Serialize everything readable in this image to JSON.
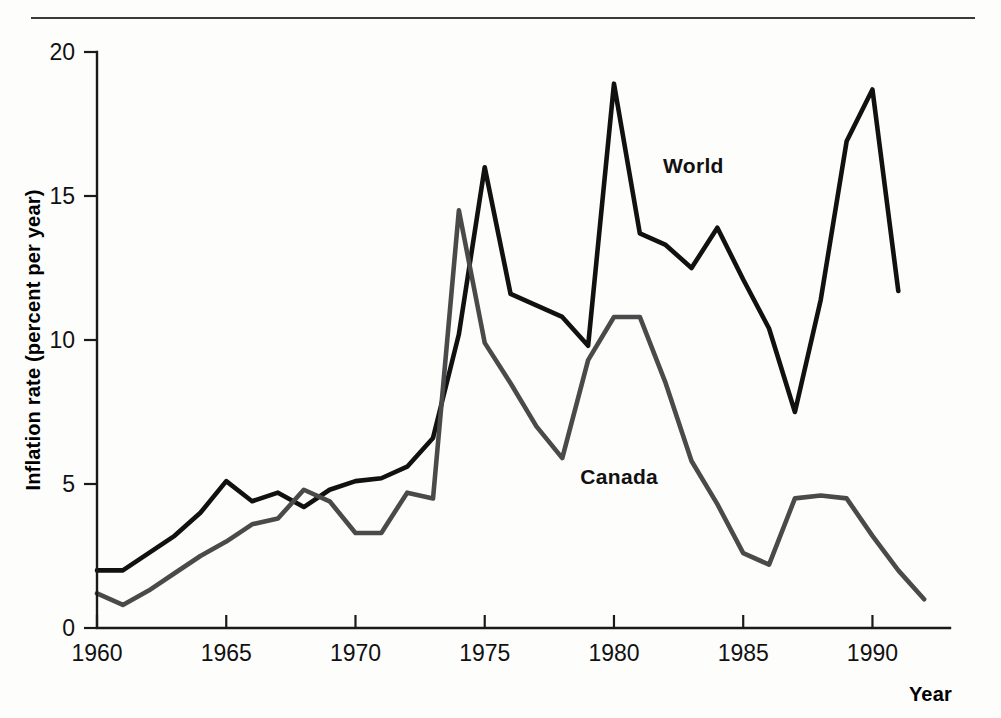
{
  "figure": {
    "has_top_rule": true,
    "background_color": "#fdfdfc"
  },
  "chart_data": {
    "type": "line",
    "title": "",
    "xlabel": "Year",
    "ylabel": "Inflation rate (percent per year)",
    "xlim": [
      1960,
      1993
    ],
    "ylim": [
      0,
      20
    ],
    "xticks": [
      1960,
      1965,
      1970,
      1975,
      1980,
      1985,
      1990
    ],
    "xtick_labels": [
      "1960",
      "1965",
      "1970",
      "1975",
      "1980",
      "1985",
      "1990"
    ],
    "yticks": [
      0,
      5,
      10,
      15,
      20
    ],
    "ytick_labels": [
      "0",
      "5",
      "10",
      "15",
      "20"
    ],
    "grid": false,
    "legend": "inline-labels",
    "series": [
      {
        "name": "World",
        "label": "World",
        "color": "#111111",
        "stroke_width": 4.6,
        "label_x": 1981.9,
        "label_y": 15.8,
        "x": [
          1960,
          1961,
          1962,
          1963,
          1964,
          1965,
          1966,
          1967,
          1968,
          1969,
          1970,
          1971,
          1972,
          1973,
          1974,
          1975,
          1976,
          1977,
          1978,
          1979,
          1980,
          1981,
          1982,
          1983,
          1984,
          1985,
          1986,
          1987,
          1988,
          1989,
          1990,
          1991
        ],
        "y": [
          2.0,
          2.0,
          2.6,
          3.2,
          4.0,
          5.1,
          4.4,
          4.7,
          4.2,
          4.8,
          5.1,
          5.2,
          5.6,
          6.6,
          10.2,
          16.0,
          11.6,
          11.2,
          10.8,
          9.8,
          18.9,
          13.7,
          13.3,
          12.5,
          13.9,
          12.1,
          10.4,
          7.5,
          11.4,
          16.9,
          18.7,
          11.7
        ]
      },
      {
        "name": "Canada",
        "label": "Canada",
        "color": "#4a4a4a",
        "stroke_width": 4.6,
        "label_x": 1978.7,
        "label_y": 5.0,
        "x": [
          1960,
          1961,
          1962,
          1963,
          1964,
          1965,
          1966,
          1967,
          1968,
          1969,
          1970,
          1971,
          1972,
          1973,
          1974,
          1975,
          1976,
          1977,
          1978,
          1979,
          1980,
          1981,
          1982,
          1983,
          1984,
          1985,
          1986,
          1987,
          1988,
          1989,
          1990,
          1991,
          1992
        ],
        "y": [
          1.2,
          0.8,
          1.3,
          1.9,
          2.5,
          3.0,
          3.6,
          3.8,
          4.8,
          4.4,
          3.3,
          3.3,
          4.7,
          4.5,
          14.5,
          9.9,
          8.5,
          7.0,
          5.9,
          9.3,
          10.8,
          10.8,
          8.5,
          5.8,
          4.3,
          2.6,
          2.2,
          4.5,
          4.6,
          4.5,
          3.2,
          2.0,
          1.0
        ]
      }
    ]
  }
}
